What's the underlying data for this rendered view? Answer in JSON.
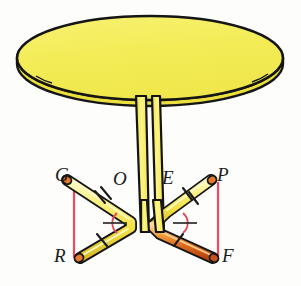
{
  "figure": {
    "kind": "geometry-illustration",
    "background_color": "#fdfdfb"
  },
  "colors": {
    "table_top_fill": "#f3ed54",
    "table_top_stroke": "#151515",
    "table_top_rim": "#efe84a",
    "column_fill": "#f5ee57",
    "column_stroke": "#141414",
    "leg_yellow": "#f5e94f",
    "leg_yellow_light": "#fdf8b6",
    "leg_orange": "#e8792a",
    "leg_orange_dark": "#c8521b",
    "leg_stroke": "#141414",
    "construction_line": "#f04860",
    "angle_arc": "#e8415c",
    "tick_mark": "#1a1a1a",
    "label_color": "#1a1a1a"
  },
  "table": {
    "top": {
      "name": "table-top",
      "shape": "ellipse",
      "cx": 150,
      "cy": 58,
      "rx": 133,
      "ry": 42
    },
    "rim": {
      "name": "table-edge-rim",
      "thickness": 6
    },
    "column": {
      "name": "table-column",
      "pipe_left_top_x": 136,
      "pipe_right_top_x": 160,
      "pipe_left_bottom_x": 141,
      "pipe_right_bottom_x": 156,
      "top_y": 98,
      "bottom_y": 228
    }
  },
  "legs": [
    {
      "name": "leg-G",
      "from": "G",
      "to": "bend-left",
      "color": "yellow",
      "ticks": 2
    },
    {
      "name": "leg-R",
      "from": "bend-left",
      "to": "R",
      "color": "yellow",
      "ticks": 1
    },
    {
      "name": "leg-P",
      "from": "P",
      "to": "bend-right",
      "color": "yellow",
      "ticks": 2
    },
    {
      "name": "leg-F",
      "from": "bend-right",
      "to": "F",
      "color": "orange",
      "ticks": 1
    }
  ],
  "points": {
    "G": {
      "label": "G",
      "x": 62,
      "y": 177,
      "label_x": 57,
      "label_y": 170
    },
    "O": {
      "label": "O",
      "x": 121,
      "y": 188,
      "label_x": 116,
      "label_y": 174
    },
    "E": {
      "label": "E",
      "x": 172,
      "y": 188,
      "label_x": 165,
      "label_y": 173
    },
    "P": {
      "label": "P",
      "x": 215,
      "y": 177,
      "label_x": 218,
      "label_y": 170
    },
    "R": {
      "label": "R",
      "x": 75,
      "y": 258,
      "label_x": 56,
      "label_y": 245
    },
    "F": {
      "label": "F",
      "x": 218,
      "y": 258,
      "label_x": 218,
      "label_y": 245
    }
  },
  "construction_lines": [
    {
      "name": "construction-line-GR",
      "x1": 74,
      "y1": 182,
      "x2": 74,
      "y2": 258
    },
    {
      "name": "construction-line-PF",
      "x1": 218,
      "y1": 182,
      "x2": 218,
      "y2": 258
    }
  ],
  "angle_arcs": [
    {
      "name": "angle-arc-left",
      "cx": 126,
      "cy": 223,
      "r": 13
    },
    {
      "name": "angle-arc-right",
      "cx": 172,
      "cy": 223,
      "r": 13
    }
  ],
  "angle_marks": [
    {
      "name": "angle-ray-left",
      "x1": 105,
      "y1": 223,
      "x2": 128,
      "y2": 223
    },
    {
      "name": "angle-ray-right",
      "x1": 170,
      "y1": 223,
      "x2": 193,
      "y2": 223
    }
  ],
  "labels": {
    "G": "G",
    "O": "O",
    "E": "E",
    "P": "P",
    "R": "R",
    "F": "F"
  }
}
